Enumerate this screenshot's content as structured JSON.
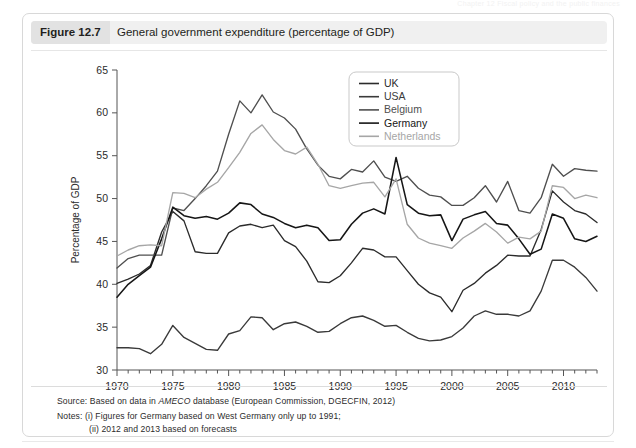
{
  "running_head": "Chapter 12  Fiscal policy and the public finances",
  "figure": {
    "number_label": "Figure 12.7",
    "caption": "General government expenditure (percentage of GDP)"
  },
  "footer": {
    "source_prefix": "Source: Based on data in ",
    "source_italic": "AMECO",
    "source_suffix": " database (European Commission, DGECFIN, 2012)",
    "note_1": "Notes: (i) Figures for Germany based on West Germany only up to 1991;",
    "note_2": "(ii) 2012 and 2013 based on forecasts"
  },
  "chart_data": {
    "type": "line",
    "title": "General government expenditure (percentage of GDP)",
    "xlabel": "",
    "ylabel": "Percentage of GDP",
    "xlim": [
      1970,
      2013
    ],
    "ylim": [
      30,
      65
    ],
    "yticks": [
      30,
      35,
      40,
      45,
      50,
      55,
      60,
      65
    ],
    "xticks": [
      1970,
      1975,
      1980,
      1985,
      1990,
      1995,
      2000,
      2005,
      2010
    ],
    "xtick_minor_step": 1,
    "grid": false,
    "legend_position": "top-right",
    "x": [
      1970,
      1971,
      1972,
      1973,
      1974,
      1975,
      1976,
      1977,
      1978,
      1979,
      1980,
      1981,
      1982,
      1983,
      1984,
      1985,
      1986,
      1987,
      1988,
      1989,
      1990,
      1991,
      1992,
      1993,
      1994,
      1995,
      1996,
      1997,
      1998,
      1999,
      2000,
      2001,
      2002,
      2003,
      2004,
      2005,
      2006,
      2007,
      2008,
      2009,
      2010,
      2011,
      2012,
      2013
    ],
    "series": [
      {
        "name": "UK",
        "color": "#2b2b2b",
        "width": 1.35,
        "values": [
          40.1,
          40.6,
          41.2,
          42.2,
          46.1,
          48.5,
          47.4,
          43.8,
          43.6,
          43.6,
          46.0,
          46.8,
          47.0,
          46.6,
          46.9,
          45.1,
          44.4,
          42.7,
          40.3,
          40.2,
          41.0,
          42.5,
          44.2,
          44.0,
          43.2,
          43.2,
          41.6,
          40.0,
          39.0,
          38.5,
          36.8,
          39.3,
          40.1,
          41.3,
          42.2,
          43.4,
          43.3,
          43.3,
          46.4,
          50.9,
          49.6,
          48.6,
          48.2,
          47.2
        ]
      },
      {
        "name": "USA",
        "color": "#3a3a3a",
        "width": 1.35,
        "values": [
          32.6,
          32.6,
          32.5,
          31.9,
          33.0,
          35.2,
          33.8,
          33.1,
          32.4,
          32.3,
          34.2,
          34.6,
          36.2,
          36.1,
          34.7,
          35.4,
          35.6,
          35.1,
          34.4,
          34.5,
          35.4,
          36.1,
          36.3,
          35.8,
          35.1,
          35.2,
          34.4,
          33.7,
          33.4,
          33.5,
          33.9,
          34.9,
          36.3,
          36.9,
          36.5,
          36.5,
          36.3,
          36.9,
          39.2,
          42.8,
          42.8,
          42.0,
          40.8,
          39.2
        ]
      },
      {
        "name": "Belgium",
        "color": "#4f4f4f",
        "width": 1.35,
        "values": [
          41.9,
          43.0,
          43.4,
          43.4,
          43.4,
          48.9,
          48.6,
          50.0,
          51.5,
          53.2,
          57.5,
          61.4,
          60.0,
          62.1,
          60.1,
          59.4,
          58.1,
          55.8,
          53.9,
          52.6,
          52.3,
          53.4,
          53.1,
          54.4,
          52.5,
          52.0,
          52.6,
          51.2,
          50.4,
          50.2,
          49.2,
          49.2,
          50.1,
          51.5,
          49.6,
          52.0,
          48.6,
          48.3,
          50.1,
          54.0,
          52.6,
          53.5,
          53.3,
          53.2
        ]
      },
      {
        "name": "Germany",
        "color": "#161616",
        "width": 1.55,
        "values": [
          38.5,
          40.0,
          41.0,
          42.0,
          45.3,
          49.0,
          48.0,
          47.7,
          47.9,
          47.6,
          48.3,
          49.5,
          49.3,
          48.2,
          47.8,
          47.1,
          46.6,
          46.9,
          46.6,
          45.1,
          45.2,
          47.0,
          48.3,
          48.8,
          48.2,
          54.8,
          49.3,
          48.3,
          48.0,
          48.1,
          45.1,
          47.6,
          48.1,
          48.5,
          47.1,
          46.9,
          45.3,
          43.5,
          44.1,
          48.2,
          47.7,
          45.3,
          45.0,
          45.6
        ]
      },
      {
        "name": "Netherlands",
        "color": "#a6a6a6",
        "width": 1.35,
        "values": [
          43.3,
          44.0,
          44.5,
          44.6,
          44.5,
          50.7,
          50.6,
          50.1,
          51.1,
          51.9,
          53.6,
          55.4,
          57.6,
          58.6,
          56.9,
          55.6,
          55.2,
          56.0,
          54.0,
          51.5,
          51.2,
          51.5,
          51.8,
          51.9,
          50.2,
          52.3,
          47.0,
          45.4,
          44.8,
          44.5,
          44.2,
          45.4,
          46.2,
          47.1,
          46.1,
          44.8,
          45.5,
          45.3,
          46.2,
          51.5,
          51.3,
          50.0,
          50.4,
          50.1
        ]
      }
    ],
    "legend": [
      {
        "label": "UK",
        "color": "#2b2b2b"
      },
      {
        "label": "USA",
        "color": "#3a3a3a"
      },
      {
        "label": "Belgium",
        "color": "#4f4f4f"
      },
      {
        "label": "Germany",
        "color": "#161616"
      },
      {
        "label": "Netherlands",
        "color": "#a6a6a6"
      }
    ]
  }
}
